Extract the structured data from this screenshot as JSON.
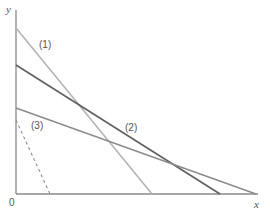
{
  "diagram": {
    "axes": {
      "y_label": "y",
      "x_label": "x",
      "origin_label": "0",
      "color": "#8a8a8a"
    },
    "lines": [
      {
        "id": "1",
        "label": "(1)",
        "color": "#b4b4b4",
        "style": "solid",
        "from": [
          16,
          28
        ],
        "to": [
          152,
          194
        ]
      },
      {
        "id": "2",
        "label": "(2)",
        "color": "#5f5f5f",
        "style": "solid",
        "from": [
          16,
          65
        ],
        "to": [
          220,
          194
        ]
      },
      {
        "id": "3",
        "label": "(3)",
        "color": "#8c8c8c",
        "style": "solid",
        "from": [
          16,
          108
        ],
        "to": [
          256,
          194
        ]
      },
      {
        "id": "dashed",
        "label": "",
        "color": "#8c8c8c",
        "style": "dashed",
        "from": [
          16,
          120
        ],
        "to": [
          50,
          194
        ]
      }
    ]
  }
}
